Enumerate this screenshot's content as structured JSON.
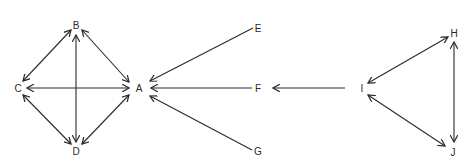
{
  "diagram": {
    "type": "directed-graph",
    "colors": {
      "stroke": "#2a2a2a",
      "background": "#ffffff"
    },
    "nodes": [
      {
        "id": "A",
        "label": "A",
        "x": 139,
        "y": 88
      },
      {
        "id": "B",
        "label": "B",
        "x": 76,
        "y": 25
      },
      {
        "id": "C",
        "label": "C",
        "x": 18,
        "y": 88
      },
      {
        "id": "D",
        "label": "D",
        "x": 76,
        "y": 151
      },
      {
        "id": "E",
        "label": "E",
        "x": 258,
        "y": 28
      },
      {
        "id": "F",
        "label": "F",
        "x": 258,
        "y": 89
      },
      {
        "id": "G",
        "label": "G",
        "x": 258,
        "y": 152
      },
      {
        "id": "H",
        "label": "H",
        "x": 454,
        "y": 34
      },
      {
        "id": "I",
        "label": "I",
        "x": 362,
        "y": 89
      },
      {
        "id": "J",
        "label": "J",
        "x": 453,
        "y": 152
      }
    ],
    "edges": [
      {
        "from": "B",
        "to": "C",
        "bidirectional": true
      },
      {
        "from": "B",
        "to": "A",
        "bidirectional": true
      },
      {
        "from": "B",
        "to": "D",
        "bidirectional": true
      },
      {
        "from": "C",
        "to": "A",
        "bidirectional": true
      },
      {
        "from": "C",
        "to": "D",
        "bidirectional": true
      },
      {
        "from": "D",
        "to": "A",
        "bidirectional": true
      },
      {
        "from": "E",
        "to": "A",
        "bidirectional": false
      },
      {
        "from": "F",
        "to": "A",
        "bidirectional": false
      },
      {
        "from": "G",
        "to": "A",
        "bidirectional": false
      },
      {
        "from": "I",
        "to": "F",
        "bidirectional": false
      },
      {
        "from": "I",
        "to": "H",
        "bidirectional": true
      },
      {
        "from": "I",
        "to": "J",
        "bidirectional": true
      },
      {
        "from": "H",
        "to": "J",
        "bidirectional": true
      }
    ]
  }
}
